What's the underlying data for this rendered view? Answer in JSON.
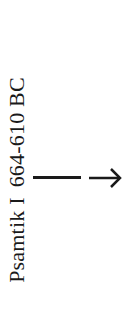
{
  "label": {
    "name": "Psamtik I",
    "dates": "664-610 BC"
  },
  "connector": {
    "line": "horizontal-line",
    "arrow": "right-arrow",
    "color": "#1a1a1a"
  }
}
